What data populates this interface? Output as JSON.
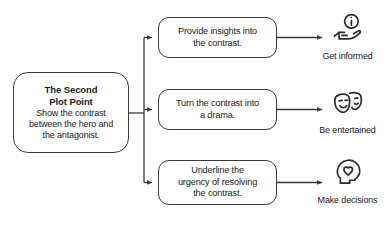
{
  "diagram": {
    "line_color": "#3a3a3a",
    "box_border_color": "#3a3a3a",
    "text_color": "#1a1a1a",
    "background": "#ffffff"
  },
  "root": {
    "title_line1": "The Second",
    "title_line2": "Plot Point",
    "desc_line1": "Show the contrast",
    "desc_line2": "between the hero and",
    "desc_line3": "the antagonist."
  },
  "steps": [
    {
      "line1": "Provide insights into",
      "line2": "the contrast.",
      "line3": ""
    },
    {
      "line1": "Turn the contrast into",
      "line2": "a drama.",
      "line3": ""
    },
    {
      "line1": "Underline the",
      "line2": "urgency of resolving",
      "line3": "the contrast."
    }
  ],
  "outcomes": [
    {
      "label": "Get informed",
      "icon": "hand-holding-info-icon"
    },
    {
      "label": "Be entertained",
      "icon": "theater-masks-icon"
    },
    {
      "label": "Make decisions",
      "icon": "head-with-heart-icon"
    }
  ]
}
